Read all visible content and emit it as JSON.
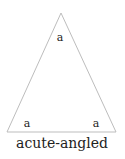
{
  "diagram": {
    "shape": "triangle",
    "stroke_color": "#bdbdbd",
    "vertices": [
      [
        61,
        13
      ],
      [
        7,
        132
      ],
      [
        116,
        132
      ]
    ],
    "angle_labels": [
      {
        "position": "apex",
        "text": "a"
      },
      {
        "position": "bottom-left",
        "text": "a"
      },
      {
        "position": "bottom-right",
        "text": "a"
      }
    ],
    "caption": "acute-angled"
  }
}
